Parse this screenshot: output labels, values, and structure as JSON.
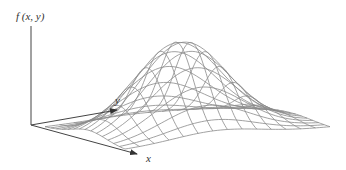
{
  "figure": {
    "type": "3d-surface-plot",
    "axis_labels": {
      "z": "f (x, y)",
      "x": "x",
      "y": "y"
    },
    "mesh": {
      "grid_lines_u": 14,
      "grid_lines_v": 14,
      "line_color": "#8a8a8a"
    },
    "axis_color": "#444444"
  }
}
